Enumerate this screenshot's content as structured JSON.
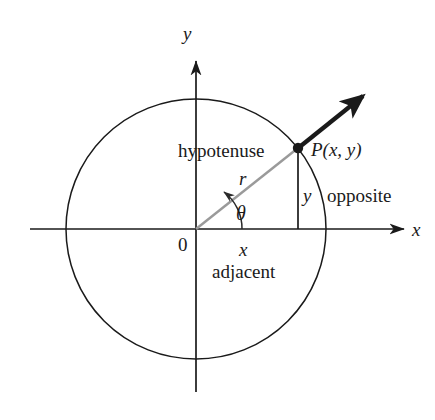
{
  "figure": {
    "type": "geometry-diagram",
    "background_color": "#ffffff",
    "stroke_color": "#1a1a1a",
    "ray_color": "#9a9a9a"
  },
  "axes": {
    "x_label": "x",
    "y_label": "y",
    "origin_label": "0"
  },
  "labels": {
    "hypotenuse": "hypotenuse",
    "radius": "r",
    "point": "P(x, y)",
    "opposite_value": "y",
    "opposite_word": "opposite",
    "adjacent_value": "x",
    "adjacent_word": "adjacent",
    "angle": "θ"
  },
  "geometry": {
    "origin": {
      "x": 196,
      "y": 229
    },
    "circle_radius": 130,
    "point_P": {
      "x": 298,
      "y": 148
    },
    "ray_tip": {
      "x": 367,
      "y": 93
    },
    "x_axis": {
      "start_x": 30,
      "end_x": 408
    },
    "y_axis": {
      "start_y": 57,
      "end_y": 392
    },
    "angle_arc_radius": 46
  }
}
